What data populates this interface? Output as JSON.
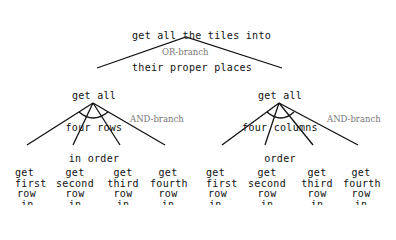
{
  "diagram": {
    "type": "AND/OR goal tree",
    "root": {
      "line1": "get all the tiles into",
      "line2": "their proper places"
    },
    "or_branch_label": "OR-branch",
    "children": [
      {
        "line1": "get all",
        "line2": "four rows",
        "line3": "in order",
        "and_branch_label": "AND-branch",
        "leaves": [
          {
            "l1": "get",
            "l2": "first",
            "l3": "row",
            "l4": "in",
            "l5": "order"
          },
          {
            "l1": "get",
            "l2": "second",
            "l3": "row",
            "l4": "in",
            "l5": "order"
          },
          {
            "l1": "get",
            "l2": "third",
            "l3": "row",
            "l4": "in",
            "l5": "order"
          },
          {
            "l1": "get",
            "l2": "fourth",
            "l3": "row",
            "l4": "in",
            "l5": "order"
          }
        ]
      },
      {
        "line1": "get all",
        "line2": "four columns",
        "line3": "order",
        "and_branch_label": "AND-branch",
        "leaves": [
          {
            "l1": "get",
            "l2": "first",
            "l3": "row",
            "l4": "in",
            "l5": "order"
          },
          {
            "l1": "get",
            "l2": "second",
            "l3": "row",
            "l4": "in",
            "l5": "order"
          },
          {
            "l1": "get",
            "l2": "third",
            "l3": "row",
            "l4": "in",
            "l5": "order"
          },
          {
            "l1": "get",
            "l2": "fourth",
            "l3": "row",
            "l4": "in",
            "l5": "order"
          }
        ]
      }
    ]
  }
}
